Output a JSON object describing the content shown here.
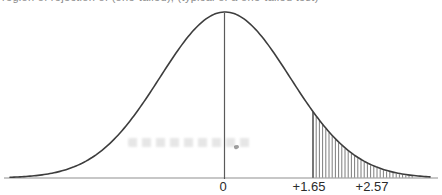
{
  "caption": {
    "text": "region of rejection of (one-tailed), (typical of a one-tailed test)",
    "clipped_at_top": true
  },
  "chart_data": {
    "type": "area",
    "title": "",
    "distribution": "standard-normal",
    "critical_region": {
      "tail": "right",
      "from_z": 1.65,
      "shading": "vertical-hatch"
    },
    "x_tick_labels": [
      "0",
      "+1.65",
      "+2.57"
    ],
    "x_tick_values": [
      0,
      1.65,
      2.57
    ],
    "ticks_px": [
      {
        "label": "0",
        "x": 223
      },
      {
        "label": "+1.65",
        "x": 309
      },
      {
        "label": "+2.57",
        "x": 372
      }
    ],
    "layout": {
      "width": 442,
      "height": 195,
      "baseline_y": 178,
      "axis_x_start": 4,
      "axis_x_end": 438,
      "curve_mu_px": 225,
      "curve_sigma_px": 65,
      "curve_amplitude_px": 166,
      "curve_x_start": 10,
      "curve_x_end": 430,
      "hatch_start_x": 313,
      "hatch_end_x": 415,
      "hatch_step_px": 3.2,
      "label_y": 191,
      "label_font_px": 13
    },
    "colors": {
      "curve": "#3d3d3d",
      "axis": "#8f8f8f",
      "center_line": "#5a5a5a",
      "boundary_line": "#3d3d3d",
      "hatch": "#6e6e6e",
      "label": "#2b2b2b",
      "background": "#ffffff"
    }
  }
}
